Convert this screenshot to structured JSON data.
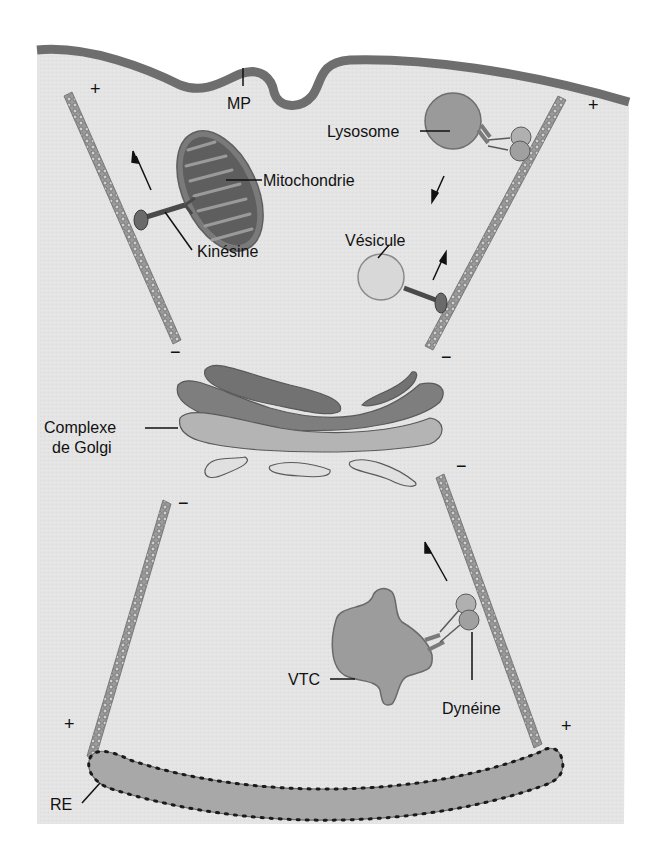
{
  "diagram": {
    "type": "cell-transport-schematic",
    "colors": {
      "cytoplasm": "#e4e4e4",
      "membrane": "#6e6e6e",
      "microtubule": "#8a8a8a",
      "mitochondria_outer": "#7a7a7a",
      "mitochondria_inner": "#5a5a5a",
      "lysosome": "#9a9a9a",
      "vesicle": "#d4d4d4",
      "golgi_dark": "#727272",
      "golgi_light": "#b0b0b0",
      "golgi_pale": "#d0d0d0",
      "vtc": "#9c9c9c",
      "er": "#a8a8a8",
      "ribosome": "#222222",
      "text": "#111111"
    },
    "labels": {
      "mp": "MP",
      "lysosome": "Lysosome",
      "mitochondrie": "Mitochondrie",
      "kinesine": "Kinésine",
      "vesicule": "Vésicule",
      "golgi_line1": "Complexe",
      "golgi_line2": "de Golgi",
      "vtc": "VTC",
      "dyneine": "Dynéine",
      "re": "RE"
    },
    "polarity": {
      "plus": "+",
      "minus": "−"
    }
  }
}
